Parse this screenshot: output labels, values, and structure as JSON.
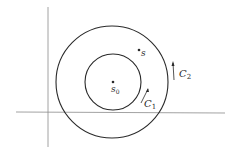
{
  "diagram": {
    "points": {
      "center": {
        "label": "s",
        "subscript": "0"
      },
      "outer_point": {
        "label": "s"
      }
    },
    "contours": {
      "inner": {
        "label": "C",
        "subscript": "1",
        "direction": "counterclockwise"
      },
      "outer": {
        "label": "C",
        "subscript": "2",
        "direction": "counterclockwise"
      }
    },
    "colors": {
      "stroke": "#2a2a2a",
      "axis": "#8a8a8a"
    }
  }
}
